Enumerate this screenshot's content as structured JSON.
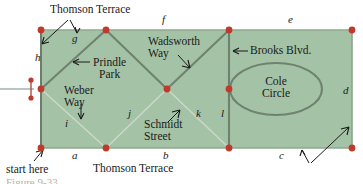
{
  "figure": {
    "kind": "graph-diagram",
    "caption": "Figure 9-33",
    "background_color": "#ffffff",
    "region_fill_color": "#a4c2a5",
    "region_edge_color": "#6e8a6e",
    "street_line_color": "#6f7f6f",
    "light_line_color": "#c9d6c7",
    "vertex_color": "#c0392b",
    "text_color": "#1a1a1a"
  },
  "edge_labels": [
    {
      "id": "a",
      "text": "a"
    },
    {
      "id": "b",
      "text": "b"
    },
    {
      "id": "c",
      "text": "c"
    },
    {
      "id": "d",
      "text": "d"
    },
    {
      "id": "e",
      "text": "e"
    },
    {
      "id": "f",
      "text": "f"
    },
    {
      "id": "g",
      "text": "g"
    },
    {
      "id": "h",
      "text": "h"
    },
    {
      "id": "i",
      "text": "i"
    },
    {
      "id": "j",
      "text": "j"
    },
    {
      "id": "k",
      "text": "k"
    },
    {
      "id": "l",
      "text": "l"
    }
  ],
  "street_names": {
    "thomson_terrace_top": "Thomson Terrace",
    "thomson_terrace_bottom": "Thomson Terrace",
    "prindle_park": "Prindle\nPark",
    "wadsworth_way": "Wadsworth\nWay",
    "brooks_blvd": "Brooks Blvd.",
    "cole_circle": "Cole\nCircle",
    "weber_way": "Weber\nWay",
    "schmidt_street": "Schmidt\nStreet"
  },
  "annotations": {
    "start_here": "start here"
  },
  "graph_data": {
    "type": "graph",
    "vertices": [
      {
        "id": "v_tl",
        "x": 41,
        "y": 30,
        "label": "top-left"
      },
      {
        "id": "v_tm",
        "x": 106,
        "y": 30,
        "label": "top-middle"
      },
      {
        "id": "v_tr2",
        "x": 229,
        "y": 30,
        "label": "top-brooks"
      },
      {
        "id": "v_tr",
        "x": 352,
        "y": 30,
        "label": "top-right"
      },
      {
        "id": "v_ml",
        "x": 41,
        "y": 89,
        "label": "mid-left"
      },
      {
        "id": "v_mc",
        "x": 167,
        "y": 89,
        "label": "mid-center"
      },
      {
        "id": "v_mr",
        "x": 229,
        "y": 89,
        "label": "mid-brooks"
      },
      {
        "id": "v_bl",
        "x": 41,
        "y": 148,
        "label": "bottom-left"
      },
      {
        "id": "v_bm1",
        "x": 106,
        "y": 148,
        "label": "bottom-1"
      },
      {
        "id": "v_bm2",
        "x": 229,
        "y": 148,
        "label": "bottom-2"
      },
      {
        "id": "v_br",
        "x": 352,
        "y": 148,
        "label": "bottom-right"
      },
      {
        "id": "v_mk1",
        "x": 31,
        "y": 80,
        "label": "marker-top"
      },
      {
        "id": "v_mk2",
        "x": 31,
        "y": 98,
        "label": "marker-bottom"
      }
    ],
    "edges": [
      {
        "from": "v_tl",
        "to": "v_tm",
        "label": "g"
      },
      {
        "from": "v_tm",
        "to": "v_tr2",
        "label": "f"
      },
      {
        "from": "v_tr2",
        "to": "v_tr",
        "label": "e"
      },
      {
        "from": "v_tr",
        "to": "v_br",
        "label": "d"
      },
      {
        "from": "v_br",
        "to": "v_bm2",
        "label": "c"
      },
      {
        "from": "v_bm2",
        "to": "v_bm1",
        "label": "b"
      },
      {
        "from": "v_bm1",
        "to": "v_bl",
        "label": "a"
      },
      {
        "from": "v_bl",
        "to": "v_ml",
        "label": ""
      },
      {
        "from": "v_ml",
        "to": "v_tl",
        "label": "h"
      },
      {
        "from": "v_ml",
        "to": "v_tm",
        "label": "prindle-park"
      },
      {
        "from": "v_tm",
        "to": "v_mc",
        "label": "prindle-park"
      },
      {
        "from": "v_mc",
        "to": "v_tr2",
        "label": "wadsworth-way"
      },
      {
        "from": "v_tr2",
        "to": "v_mr",
        "label": "brooks-blvd"
      },
      {
        "from": "v_ml",
        "to": "v_bm1",
        "label": "i"
      },
      {
        "from": "v_bm1",
        "to": "v_mc",
        "label": "j"
      },
      {
        "from": "v_mc",
        "to": "v_bm2",
        "label": "k"
      },
      {
        "from": "v_mr",
        "to": "v_bm2",
        "label": "l"
      }
    ],
    "ellipse": {
      "id": "cole-circle",
      "cx": 276,
      "cy": 89,
      "rx": 46,
      "ry": 26
    }
  }
}
